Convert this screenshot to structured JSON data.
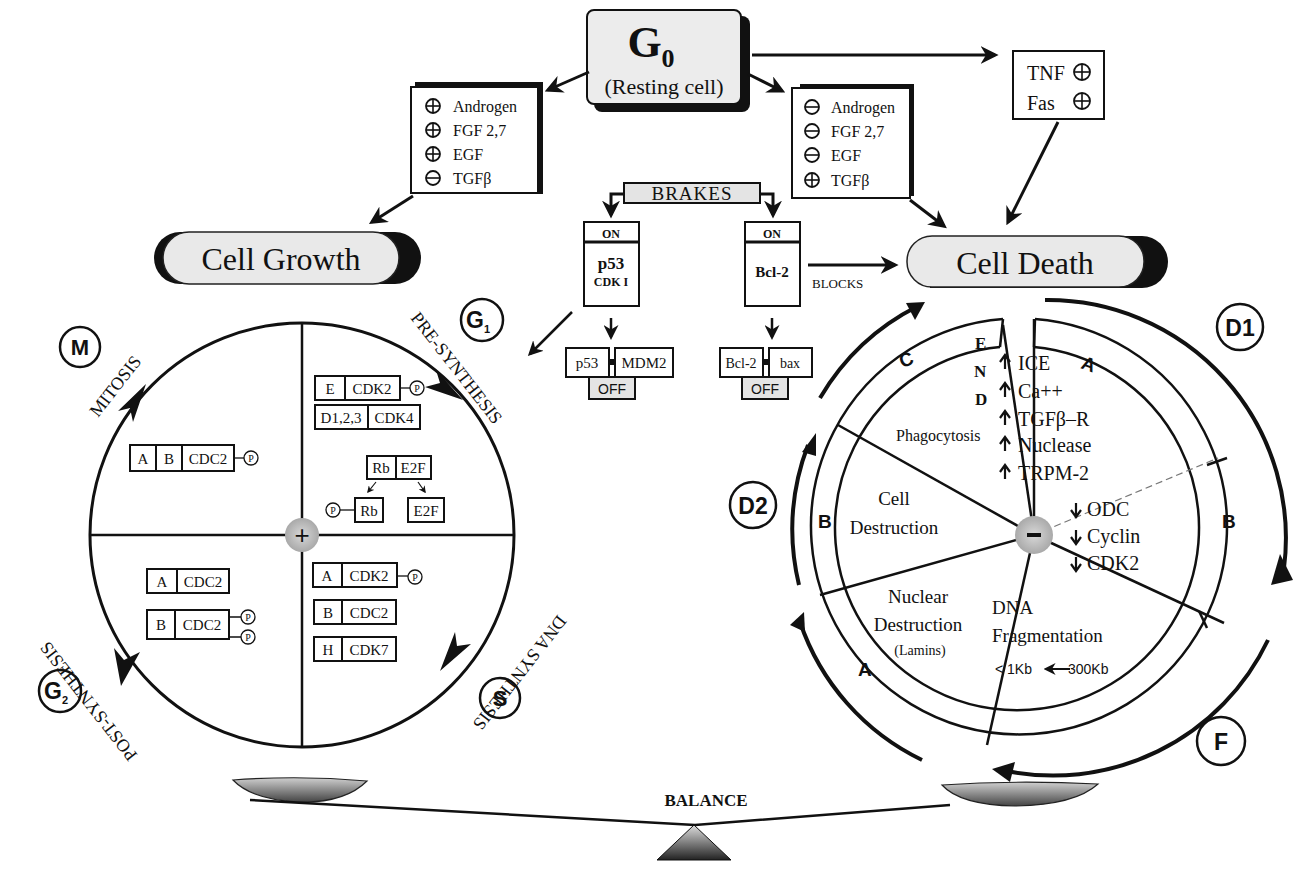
{
  "g0": {
    "title": "G",
    "subscript": "0",
    "subtitle": "(Resting cell)"
  },
  "growth_factors": {
    "items": [
      {
        "sign": "+",
        "label": "Androgen"
      },
      {
        "sign": "+",
        "label": "FGF 2,7"
      },
      {
        "sign": "+",
        "label": "EGF"
      },
      {
        "sign": "-",
        "label": "TGFβ"
      }
    ]
  },
  "death_factors": {
    "items": [
      {
        "sign": "-",
        "label": "Androgen"
      },
      {
        "sign": "-",
        "label": "FGF 2,7"
      },
      {
        "sign": "-",
        "label": "EGF"
      },
      {
        "sign": "+",
        "label": "TGFβ"
      }
    ]
  },
  "receptors": {
    "items": [
      {
        "label": "TNF",
        "sign": "+"
      },
      {
        "label": "Fas",
        "sign": "+"
      }
    ]
  },
  "brakes": {
    "label": "BRAKES",
    "left": {
      "state": "ON",
      "line1": "p53",
      "line2": "CDK I",
      "complex_a": "p53",
      "complex_b": "MDM2",
      "off": "OFF"
    },
    "right": {
      "state": "ON",
      "line1": "Bcl-2",
      "complex_a": "Bcl-2",
      "complex_b": "bax",
      "off": "OFF",
      "blocks": "BLOCKS"
    }
  },
  "cell_growth": {
    "label": "Cell Growth",
    "center_sign": "+",
    "phases": {
      "m": {
        "badge": "M",
        "label": "MITOSIS"
      },
      "g1": {
        "badge": "G",
        "badge_sub": "1",
        "label": "PRE-SYNTHESIS"
      },
      "s": {
        "badge": "S",
        "label": "DNA SYNTHESIS"
      },
      "g2": {
        "badge": "G",
        "badge_sub": "2",
        "label": "POST-SYNTHESIS"
      }
    },
    "complexes": {
      "m": [
        {
          "cells": [
            "A",
            "B",
            "CDC2"
          ],
          "phos": 1
        }
      ],
      "g1": [
        {
          "cells": [
            "E",
            "CDK2"
          ],
          "phos": 1
        },
        {
          "cells": [
            "D1,2,3",
            "CDK4"
          ],
          "phos": 0
        }
      ],
      "rb": {
        "top": [
          "Rb",
          "E2F"
        ],
        "left": "Rb",
        "right": "E2F",
        "p": "P"
      },
      "s": [
        {
          "cells": [
            "A",
            "CDK2"
          ],
          "phos": 1
        },
        {
          "cells": [
            "B",
            "CDC2"
          ],
          "phos": 0
        },
        {
          "cells": [
            "H",
            "CDK7"
          ],
          "phos": 0
        }
      ],
      "g2": [
        {
          "cells": [
            "A",
            "CDC2"
          ],
          "phos": 0
        },
        {
          "cells": [
            "B",
            "CDC2"
          ],
          "phos": 2
        }
      ]
    },
    "phospho_label": "P"
  },
  "cell_death": {
    "label": "Cell Death",
    "center_sign": "−",
    "end_letters": [
      "E",
      "N",
      "D"
    ],
    "badges": {
      "d1": "D1",
      "d2": "D2",
      "f": "F"
    },
    "ring_labels": {
      "a_top": "A",
      "b_right": "B",
      "c": "C",
      "b_left": "B",
      "a_bottom": "A"
    },
    "up_list": [
      "ICE",
      "Ca++",
      "TGFβ–R",
      "Nuclease",
      "TRPM-2"
    ],
    "down_list": [
      "ODC",
      "Cyclin",
      "CDK2"
    ],
    "sectors": {
      "phagocytosis": "Phagocytosis",
      "cell_destruction": [
        "Cell",
        "Destruction"
      ],
      "nuclear_destruction": [
        "Nuclear",
        "Destruction",
        "(Lamins)"
      ],
      "dna_fragmentation": [
        "DNA",
        "Fragmentation"
      ],
      "fragment_sizes": {
        "from": "300Kb",
        "to": "< 1Kb"
      }
    }
  },
  "balance": {
    "label": "BALANCE"
  }
}
